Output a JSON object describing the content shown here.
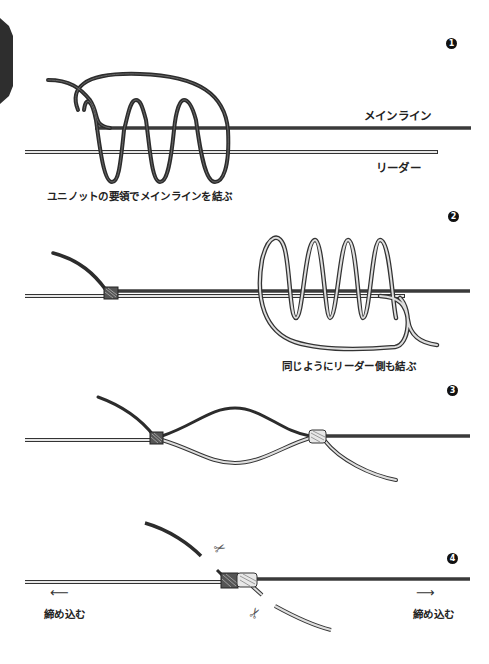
{
  "figure": {
    "side_tab_color": "#2e2e2e",
    "main_line_color": "#333333",
    "leader_line_color": "#cfcfcf",
    "steps": [
      {
        "number": "1",
        "caption": "ユニノットの要領でメインラインを結ぶ",
        "labels": {
          "main_line": "メインライン",
          "leader": "リーダー"
        }
      },
      {
        "number": "2",
        "caption": "同じようにリーダー側も結ぶ"
      },
      {
        "number": "3",
        "caption": ""
      },
      {
        "number": "4",
        "left_label": "締め込む",
        "right_label": "締め込む",
        "icons": [
          "scissors-icon",
          "scissors-icon",
          "arrow-left-icon",
          "arrow-right-icon"
        ]
      }
    ]
  }
}
